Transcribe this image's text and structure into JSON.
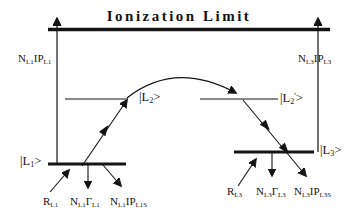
{
  "diagram": {
    "title": "Ionization Limit",
    "colors": {
      "ink": "#141414",
      "background": "#ffffff"
    }
  },
  "states": {
    "l1": {
      "open": "|L",
      "sub": "1",
      "close": ">"
    },
    "l2": {
      "open": "|L",
      "sub": "2",
      "close": ">"
    },
    "l2_prime": {
      "open": "|L",
      "sub": "2",
      "prime": "'",
      "close": ">"
    },
    "l3": {
      "open": "|L",
      "sub": "3",
      "close": ">"
    }
  },
  "rates": {
    "left_ionization": {
      "n": "N",
      "n_sub": "L1",
      "ip": "IP",
      "ip_sub": "L1"
    },
    "right_ionization": {
      "n": "N",
      "n_sub": "L3",
      "ip": "IP",
      "ip_sub": "L3"
    },
    "left_pump": {
      "r": "R",
      "r_sub": "L1"
    },
    "left_decay": {
      "n": "N",
      "n_sub": "L1",
      "gamma": "Γ",
      "gamma_sub": "L1"
    },
    "left_loss": {
      "n": "N",
      "n_sub": "L1",
      "ip": "IP",
      "ip_sub": "L1S"
    },
    "right_pump": {
      "r": "R",
      "r_sub": "L3"
    },
    "right_decay": {
      "n": "N",
      "n_sub": "L3",
      "gamma": "Γ",
      "gamma_sub": "L3"
    },
    "right_loss": {
      "n": "N",
      "n_sub": "L3",
      "ip": "IP",
      "ip_sub": "L3S"
    }
  }
}
